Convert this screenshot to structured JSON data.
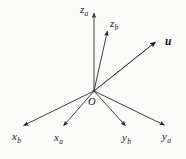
{
  "figure": {
    "background_color": "#fbfbf9",
    "stroke_color": "#2b2b2b",
    "origin": {
      "label": "O",
      "x": 94,
      "y": 91,
      "label_x": 88,
      "label_y": 97
    }
  },
  "axes": [
    {
      "id": "z-a",
      "name": "z_a",
      "base": "z",
      "subscript": "a",
      "tip_x": 94,
      "tip_y": 11,
      "label_x": 80,
      "label_y": 4
    },
    {
      "id": "z-b",
      "name": "z_b",
      "base": "z",
      "subscript": "b",
      "tip_x": 108,
      "tip_y": 29,
      "label_x": 110,
      "label_y": 18
    },
    {
      "id": "x-b",
      "name": "x_b",
      "base": "x",
      "subscript": "b",
      "tip_x": 21,
      "tip_y": 127,
      "label_x": 12,
      "label_y": 131
    },
    {
      "id": "x-a",
      "name": "x_a",
      "base": "x",
      "subscript": "a",
      "tip_x": 62,
      "tip_y": 128,
      "label_x": 54,
      "label_y": 132
    },
    {
      "id": "y-b",
      "name": "y_b",
      "base": "y",
      "subscript": "b",
      "tip_x": 127,
      "tip_y": 128,
      "label_x": 122,
      "label_y": 132
    },
    {
      "id": "y-a",
      "name": "y_a",
      "base": "y",
      "subscript": "a",
      "tip_x": 167,
      "tip_y": 127,
      "label_x": 162,
      "label_y": 131
    }
  ],
  "vectors": [
    {
      "id": "u",
      "name": "u",
      "label": "u",
      "tip_x": 158,
      "tip_y": 40,
      "label_x": 165,
      "label_y": 36
    }
  ]
}
